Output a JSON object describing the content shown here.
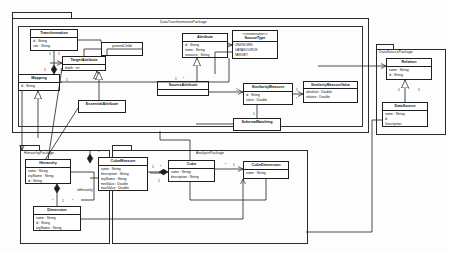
{
  "diagram": {
    "type": "uml-class-diagram",
    "canvas": {
      "width": 449,
      "height": 253,
      "background": "#fdfdfd"
    },
    "line_color": "#1e1e1e"
  },
  "packages": [
    {
      "id": "data-transformation-package",
      "label": "DataTransformationPackage"
    },
    {
      "id": "data-source-package",
      "label": "DataSourcePackage"
    },
    {
      "id": "hierarchy-package",
      "label": "HierarchyPackage"
    },
    {
      "id": "analysis-package",
      "label": "AnalysisPackage"
    }
  ],
  "classes": {
    "transformation": {
      "name": "Transformation",
      "attributes": [
        "id : String",
        "rule : String"
      ]
    },
    "mapping": {
      "name": "Mapping",
      "attributes": [
        "id : String"
      ]
    },
    "target_attribute": {
      "name": "TargetAttribute",
      "attributes": [
        "depth : int"
      ]
    },
    "parent_child": {
      "name": "parentChild",
      "attributes": []
    },
    "essential_attribute": {
      "name": "EssentialAttribute",
      "attributes": []
    },
    "source_attribute": {
      "name": "SourceAttribute",
      "attributes": []
    },
    "attribute": {
      "name": "Attribute",
      "attributes": [
        "id : String",
        "name : String",
        "resource : String"
      ]
    },
    "source_type": {
      "stereotype": "<<enumeration>>",
      "name": "SourceType",
      "attributes": [
        "UNKNOWN",
        "DATASOURCE",
        "TARGET"
      ]
    },
    "similarity_measure": {
      "name": "SimilarityMeasure",
      "attributes": [
        "id : String",
        "value : Double"
      ]
    },
    "similarity_measure_value": {
      "name": "SimilarityMeasureValue",
      "attributes": [
        "absolute : Double",
        "relative : Double"
      ]
    },
    "schema_matching": {
      "name": "SchemaMatching",
      "attributes": []
    },
    "relation": {
      "name": "Relation",
      "attributes": [
        "name : String",
        "id : String"
      ]
    },
    "datasource": {
      "name": "DataSource",
      "attributes": [
        "name : String",
        "id",
        "Description"
      ]
    },
    "hierarchy": {
      "name": "Hierarchy",
      "attributes": [
        "name : String",
        "keyName : String",
        "id : String"
      ]
    },
    "dimension": {
      "name": "Dimension",
      "attributes": [
        "name : String",
        "id : String",
        "keyName : String"
      ]
    },
    "cube_measure": {
      "name": "CubeMeasure",
      "attributes": [
        "name : String",
        "description : String",
        "keyName : String",
        "minValue : Double",
        "maxValue : Double"
      ]
    },
    "cube": {
      "name": "Cube",
      "attributes": [
        "name : String",
        "description : String"
      ]
    },
    "cube_dimension": {
      "name": "CubeDimension",
      "attributes": [
        "name : String"
      ]
    }
  },
  "association_labels": [
    {
      "id": "measures",
      "text": "measures"
    },
    {
      "id": "ishierarchy",
      "text": "isHierarchy"
    }
  ],
  "multiplicities": [
    {
      "id": "m1",
      "text": "1"
    },
    {
      "id": "m2",
      "text": "1"
    },
    {
      "id": "m3",
      "text": "1"
    },
    {
      "id": "m4",
      "text": "1"
    },
    {
      "id": "m5",
      "text": "1"
    },
    {
      "id": "m6",
      "text": "1"
    },
    {
      "id": "m7",
      "text": "*"
    },
    {
      "id": "m8",
      "text": "1"
    },
    {
      "id": "m9",
      "text": "1"
    },
    {
      "id": "m10",
      "text": "1"
    },
    {
      "id": "m11",
      "text": "*"
    },
    {
      "id": "m12",
      "text": "1"
    },
    {
      "id": "m13",
      "text": "1"
    },
    {
      "id": "m14",
      "text": "*"
    },
    {
      "id": "m15",
      "text": "1"
    },
    {
      "id": "m16",
      "text": "*"
    },
    {
      "id": "m17",
      "text": "1"
    },
    {
      "id": "m18",
      "text": "*"
    },
    {
      "id": "m19",
      "text": "1"
    },
    {
      "id": "m20",
      "text": "*"
    },
    {
      "id": "m21",
      "text": "1"
    },
    {
      "id": "m22",
      "text": "*"
    },
    {
      "id": "m23",
      "text": "1"
    },
    {
      "id": "m24",
      "text": "*"
    }
  ]
}
